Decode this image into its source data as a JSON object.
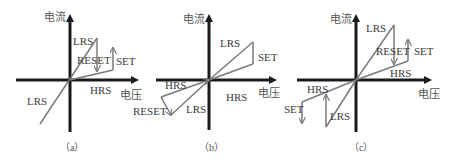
{
  "colors": {
    "axis": "#1a1a1a",
    "curve": "#7a7a7a",
    "text": "#3a3a3a"
  },
  "axes": {
    "y_label": "电流",
    "x_label": "电压"
  },
  "panels": [
    {
      "id": "a",
      "caption": "（a）",
      "labels": {
        "lrs_top": "LRS",
        "reset": "RESET",
        "set": "SET",
        "hrs": "HRS",
        "lrs_bottom": "LRS"
      }
    },
    {
      "id": "b",
      "caption": "（b）",
      "labels": {
        "lrs_top": "LRS",
        "set": "SET",
        "hrs_left": "HRS",
        "hrs_right": "HRS",
        "reset": "RESET",
        "lrs_bottom": "LRS"
      }
    },
    {
      "id": "c",
      "caption": "（c）",
      "labels": {
        "lrs_top": "LRS",
        "reset": "RESET",
        "set_top": "SET",
        "hrs_right": "HRS",
        "hrs_left": "HRS",
        "set_bottom": "SET",
        "lrs_bottom": "LRS"
      }
    }
  ]
}
